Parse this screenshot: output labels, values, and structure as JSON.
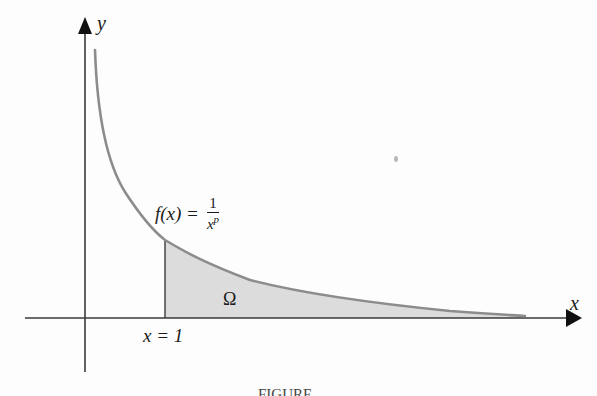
{
  "diagram": {
    "type": "function-graph",
    "axes": {
      "x_label": "x",
      "y_label": "y",
      "axis_color": "#3a3a3a"
    },
    "curve": {
      "label_prefix": "f(x) =",
      "numerator": "1",
      "denominator_base": "x",
      "denominator_exp": "p",
      "color": "#8c8c8c"
    },
    "region": {
      "label": "Ω",
      "fill_color": "#d9d9d9"
    },
    "marker": {
      "label": "x = 1"
    },
    "caption": {
      "text": "FIGURE"
    }
  }
}
